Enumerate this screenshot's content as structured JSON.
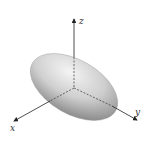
{
  "diagram": {
    "type": "3d-surface",
    "shape": "ellipsoid",
    "axes": {
      "x": {
        "label": "x"
      },
      "y": {
        "label": "y"
      },
      "z": {
        "label": "z"
      }
    },
    "colors": {
      "surface_light": "#f2f2f2",
      "surface_dark": "#8a8a8a",
      "axis": "#222222"
    }
  }
}
